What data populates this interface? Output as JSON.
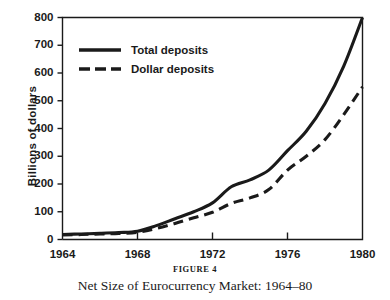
{
  "chart_data": {
    "type": "line",
    "title": "Net Size of Eurocurrency Market: 1964–80",
    "figure_label": "FIGURE 4",
    "xlabel": "",
    "ylabel": "Billions of dollars",
    "xlim": [
      1964,
      1980
    ],
    "ylim": [
      0,
      800
    ],
    "grid": false,
    "legend_position": "top-left inside plot",
    "x": [
      1964,
      1965,
      1966,
      1967,
      1968,
      1969,
      1970,
      1971,
      1972,
      1973,
      1974,
      1975,
      1976,
      1977,
      1978,
      1979,
      1980
    ],
    "x_tick_labels": [
      "1964",
      "1968",
      "1972",
      "1976",
      "1980"
    ],
    "x_ticks": [
      1964,
      1968,
      1972,
      1976,
      1980
    ],
    "y_ticks": [
      0,
      100,
      200,
      300,
      400,
      500,
      600,
      700,
      800
    ],
    "y_tick_labels": [
      "0",
      "100",
      "200",
      "300",
      "400",
      "500",
      "600",
      "700",
      "800"
    ],
    "series": [
      {
        "name": "Total deposits",
        "style": "solid",
        "color": "#1a1a1a",
        "values": [
          18,
          20,
          22,
          25,
          30,
          50,
          75,
          100,
          132,
          190,
          215,
          250,
          320,
          390,
          490,
          625,
          800
        ]
      },
      {
        "name": "Dollar deposits",
        "style": "dashed",
        "color": "#1a1a1a",
        "values": [
          16,
          18,
          20,
          22,
          26,
          40,
          58,
          78,
          98,
          130,
          150,
          180,
          250,
          300,
          360,
          450,
          550
        ]
      }
    ]
  },
  "legend": {
    "items": [
      {
        "label": "Total deposits",
        "style": "solid"
      },
      {
        "label": "Dollar deposits",
        "style": "dashed"
      }
    ]
  },
  "caption": {
    "figure": "FIGURE 4",
    "title": "Net Size of Eurocurrency Market: 1964–80"
  },
  "axes": {
    "y_title": "Billions of dollars"
  },
  "colors": {
    "ink": "#1a1a1a",
    "background": "#ffffff"
  }
}
